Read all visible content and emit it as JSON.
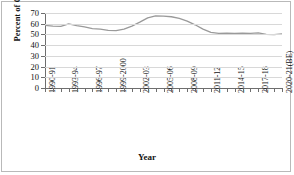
{
  "chart_data": {
    "type": "line",
    "title": "",
    "xlabel": "Year",
    "ylabel": "Percent of GDP",
    "ylim": [
      0,
      70
    ],
    "ytick_labels": [
      "0",
      "10",
      "20",
      "30",
      "40",
      "50",
      "60",
      "70"
    ],
    "yticks": [
      0,
      10,
      20,
      30,
      40,
      50,
      60,
      70
    ],
    "grid": true,
    "legend": "none",
    "line_color": "#9a9a9a",
    "categories": [
      "1990-91",
      "1991-92",
      "1992-93",
      "1993-94",
      "1994-95",
      "1995-96",
      "1996-97",
      "1997-98",
      "1998-99",
      "1999-2000",
      "2000-01",
      "2001-02",
      "2002-03",
      "2003-04",
      "2004-05",
      "2005-06",
      "2006-07",
      "2007-08",
      "2008-09",
      "2009-10",
      "2010-11",
      "2011-12",
      "2012-13",
      "2013-14",
      "2014-15",
      "2015-16",
      "2016-17",
      "2017-18",
      "2018-19",
      "2019-20",
      "2020-21(BE)"
    ],
    "tick_labels_shown": [
      "1990-91",
      "1993-94",
      "1996-97",
      "1999-2000",
      "2002-03",
      "2005-06",
      "2008-09",
      "2011-12",
      "2014-15",
      "2017-18",
      "2020-21(BE)"
    ],
    "values": [
      58.5,
      57.8,
      57.5,
      59.8,
      58.2,
      57.0,
      55.5,
      55.0,
      53.8,
      53.6,
      55.0,
      57.8,
      61.5,
      65.5,
      67.3,
      67.0,
      66.5,
      65.0,
      62.5,
      59.0,
      55.0,
      52.0,
      51.0,
      51.2,
      51.0,
      51.2,
      51.0,
      51.5,
      50.0,
      49.8,
      50.5
    ],
    "series": [
      {
        "name": "Debt as percent of GDP",
        "values": [
          58.5,
          57.8,
          57.5,
          59.8,
          58.2,
          57.0,
          55.5,
          55.0,
          53.8,
          53.6,
          55.0,
          57.8,
          61.5,
          65.5,
          67.3,
          67.0,
          66.5,
          65.0,
          62.5,
          59.0,
          55.0,
          52.0,
          51.0,
          51.2,
          51.0,
          51.2,
          51.0,
          51.5,
          50.0,
          49.8,
          50.5
        ]
      }
    ]
  }
}
